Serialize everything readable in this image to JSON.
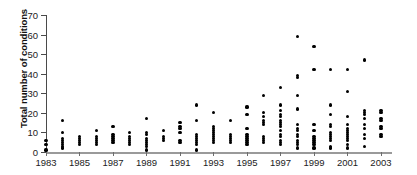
{
  "chart_data": {
    "type": "scatter",
    "title": "",
    "xlabel": "",
    "ylabel": "Total number of conditions",
    "xlim": [
      1983,
      2003.6
    ],
    "ylim": [
      0,
      70
    ],
    "ytick_values": [
      0,
      10,
      20,
      30,
      40,
      50,
      60,
      70
    ],
    "ytick_labels": [
      "0",
      "10",
      "20",
      "30",
      "40",
      "50",
      "60",
      "70"
    ],
    "xtick_values": [
      1983,
      1985,
      1987,
      1989,
      1991,
      1993,
      1995,
      1997,
      1999,
      2001,
      2003
    ],
    "xtick_labels": [
      "1983",
      "1985",
      "1987",
      "1989",
      "1991",
      "1993",
      "1995",
      "1997",
      "1999",
      "2001",
      "2003"
    ],
    "grid": false,
    "legend": false,
    "marker": "filled-circle",
    "marker_color": "#000000",
    "axis_color": "#4a4a4a",
    "series": [
      {
        "name": "conditions",
        "points": [
          [
            1983,
            1
          ],
          [
            1983,
            4
          ],
          [
            1983,
            6
          ],
          [
            1984,
            2
          ],
          [
            1984,
            3
          ],
          [
            1984,
            4
          ],
          [
            1984,
            5
          ],
          [
            1984,
            6
          ],
          [
            1984,
            7
          ],
          [
            1984,
            10
          ],
          [
            1984,
            16
          ],
          [
            1985,
            4
          ],
          [
            1985,
            5
          ],
          [
            1985,
            6
          ],
          [
            1985,
            7
          ],
          [
            1985,
            8
          ],
          [
            1986,
            4
          ],
          [
            1986,
            5
          ],
          [
            1986,
            6
          ],
          [
            1986,
            7
          ],
          [
            1986,
            8
          ],
          [
            1986,
            11
          ],
          [
            1987,
            5
          ],
          [
            1987,
            6
          ],
          [
            1987,
            7
          ],
          [
            1987,
            8
          ],
          [
            1987,
            9
          ],
          [
            1987,
            13
          ],
          [
            1988,
            4
          ],
          [
            1988,
            5
          ],
          [
            1988,
            6
          ],
          [
            1988,
            7
          ],
          [
            1988,
            8
          ],
          [
            1988,
            10
          ],
          [
            1989,
            1
          ],
          [
            1989,
            3
          ],
          [
            1989,
            4
          ],
          [
            1989,
            5
          ],
          [
            1989,
            6
          ],
          [
            1989,
            7
          ],
          [
            1989,
            9
          ],
          [
            1989,
            10
          ],
          [
            1989,
            17
          ],
          [
            1990,
            6
          ],
          [
            1990,
            7
          ],
          [
            1990,
            8
          ],
          [
            1990,
            11
          ],
          [
            1991,
            5
          ],
          [
            1991,
            6
          ],
          [
            1991,
            10
          ],
          [
            1991,
            12
          ],
          [
            1991,
            13
          ],
          [
            1991,
            15
          ],
          [
            1992,
            1
          ],
          [
            1992,
            4
          ],
          [
            1992,
            5
          ],
          [
            1992,
            6
          ],
          [
            1992,
            7
          ],
          [
            1992,
            8
          ],
          [
            1992,
            9
          ],
          [
            1992,
            16
          ],
          [
            1992,
            24
          ],
          [
            1993,
            5
          ],
          [
            1993,
            6
          ],
          [
            1993,
            7
          ],
          [
            1993,
            8
          ],
          [
            1993,
            9
          ],
          [
            1993,
            10
          ],
          [
            1993,
            11
          ],
          [
            1993,
            12
          ],
          [
            1993,
            13
          ],
          [
            1993,
            20
          ],
          [
            1994,
            5
          ],
          [
            1994,
            6
          ],
          [
            1994,
            7
          ],
          [
            1994,
            8
          ],
          [
            1994,
            9
          ],
          [
            1994,
            16
          ],
          [
            1995,
            4
          ],
          [
            1995,
            5
          ],
          [
            1995,
            6
          ],
          [
            1995,
            7
          ],
          [
            1995,
            8
          ],
          [
            1995,
            9
          ],
          [
            1995,
            12
          ],
          [
            1995,
            19
          ],
          [
            1995,
            23
          ],
          [
            1996,
            5
          ],
          [
            1996,
            6
          ],
          [
            1996,
            7
          ],
          [
            1996,
            8
          ],
          [
            1996,
            14
          ],
          [
            1996,
            15
          ],
          [
            1996,
            16
          ],
          [
            1996,
            18
          ],
          [
            1996,
            20
          ],
          [
            1996,
            29
          ],
          [
            1997,
            4
          ],
          [
            1997,
            5
          ],
          [
            1997,
            6
          ],
          [
            1997,
            8
          ],
          [
            1997,
            9
          ],
          [
            1997,
            11
          ],
          [
            1997,
            13
          ],
          [
            1997,
            14
          ],
          [
            1997,
            15
          ],
          [
            1997,
            16
          ],
          [
            1997,
            18
          ],
          [
            1997,
            19
          ],
          [
            1997,
            21
          ],
          [
            1997,
            24
          ],
          [
            1997,
            33
          ],
          [
            1998,
            2
          ],
          [
            1998,
            4
          ],
          [
            1998,
            5
          ],
          [
            1998,
            6
          ],
          [
            1998,
            8
          ],
          [
            1998,
            9
          ],
          [
            1998,
            11
          ],
          [
            1998,
            12
          ],
          [
            1998,
            14
          ],
          [
            1998,
            22
          ],
          [
            1998,
            29
          ],
          [
            1998,
            38
          ],
          [
            1998,
            39
          ],
          [
            1998,
            59
          ],
          [
            1999,
            2
          ],
          [
            1999,
            4
          ],
          [
            1999,
            5
          ],
          [
            1999,
            6
          ],
          [
            1999,
            7
          ],
          [
            1999,
            8
          ],
          [
            1999,
            11
          ],
          [
            1999,
            14
          ],
          [
            1999,
            42
          ],
          [
            1999,
            54
          ],
          [
            2000,
            2
          ],
          [
            2000,
            3
          ],
          [
            2000,
            6
          ],
          [
            2000,
            7
          ],
          [
            2000,
            8
          ],
          [
            2000,
            9
          ],
          [
            2000,
            10
          ],
          [
            2000,
            13
          ],
          [
            2000,
            14
          ],
          [
            2000,
            19
          ],
          [
            2000,
            24
          ],
          [
            2000,
            42
          ],
          [
            2001,
            2
          ],
          [
            2001,
            4
          ],
          [
            2001,
            6
          ],
          [
            2001,
            7
          ],
          [
            2001,
            8
          ],
          [
            2001,
            9
          ],
          [
            2001,
            10
          ],
          [
            2001,
            11
          ],
          [
            2001,
            12
          ],
          [
            2001,
            14
          ],
          [
            2001,
            18
          ],
          [
            2001,
            31
          ],
          [
            2001,
            42
          ],
          [
            2002,
            3
          ],
          [
            2002,
            7
          ],
          [
            2002,
            9
          ],
          [
            2002,
            12
          ],
          [
            2002,
            14
          ],
          [
            2002,
            17
          ],
          [
            2002,
            19
          ],
          [
            2002,
            20
          ],
          [
            2002,
            21
          ],
          [
            2002,
            47
          ],
          [
            2003,
            8
          ],
          [
            2003,
            9
          ],
          [
            2003,
            12
          ],
          [
            2003,
            13
          ],
          [
            2003,
            16
          ],
          [
            2003,
            17
          ],
          [
            2003,
            20
          ],
          [
            2003,
            21
          ]
        ]
      }
    ]
  }
}
